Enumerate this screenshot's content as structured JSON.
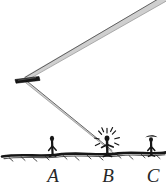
{
  "figure": {
    "background_color": "#ffffff",
    "ink_color": "#1a1a1a",
    "ray_fill_color": "#c8c8c8",
    "ray_edge_color": "#555555",
    "width": 166,
    "height": 189
  },
  "mirror": {
    "name": "mirror",
    "x": 26,
    "y": 78,
    "angle_deg": -8,
    "length": 20,
    "thickness": 4,
    "color": "#111111"
  },
  "rays": [
    {
      "id": "incident-ray",
      "label": "incoming ray",
      "from": {
        "x": 166,
        "y": -6
      },
      "to": {
        "x": 24,
        "y": 78
      },
      "width": 3.2
    },
    {
      "id": "reflected-ray",
      "label": "reflected ray",
      "from": {
        "x": 24,
        "y": 80
      },
      "to": {
        "x": 112,
        "y": 152
      },
      "width": 3.2
    }
  ],
  "ground": {
    "name": "ground-line",
    "y": 155,
    "x_start": 2,
    "x_end": 166,
    "hatch_count": 13
  },
  "observers": [
    {
      "id": "observer-a",
      "label": "A",
      "x": 52,
      "base_y": 155,
      "height": 17,
      "head": "round",
      "struck": false
    },
    {
      "id": "observer-b",
      "label": "B",
      "x": 107,
      "base_y": 155,
      "height": 17,
      "head": "round",
      "struck": true,
      "burst_rays": 9
    },
    {
      "id": "observer-c",
      "label": "C",
      "x": 151,
      "base_y": 155,
      "height": 16,
      "head": "hat",
      "struck": false
    }
  ],
  "labels": {
    "a": "A",
    "b": "B",
    "c": "C"
  }
}
